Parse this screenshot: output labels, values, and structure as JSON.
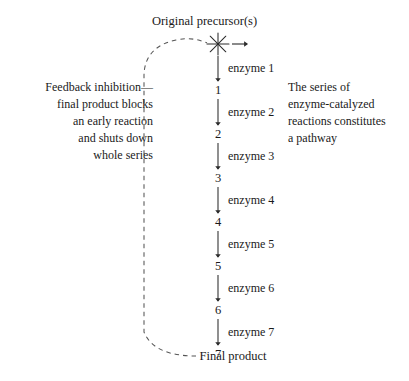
{
  "diagram": {
    "title_top": "Original precursor(s)",
    "final_product": "Final product",
    "axis_x": 218,
    "colors": {
      "ink": "#1a1a1a",
      "line": "#2b2b2b",
      "dashed": "#555555",
      "background": "#ffffff"
    },
    "notes": {
      "feedback": {
        "lines": [
          "Feedback inhibition—",
          "final product blocks",
          "an early reaction",
          "and shuts down",
          "whole series"
        ],
        "text": "Feedback inhibition—\nfinal product blocks\nan early reaction\nand shuts down\nwhole series"
      },
      "pathway": {
        "lines": [
          "The series of",
          "enzyme-catalyzed",
          "reactions constitutes",
          "a pathway"
        ],
        "text": "The series of\nenzyme-catalyzed\nreactions constitutes\na pathway"
      }
    },
    "starburst": {
      "name": "inhibition-point",
      "rays": 8,
      "cx": 218,
      "cy": 44,
      "radius": 11
    },
    "steps": [
      {
        "enzyme": "enzyme 1",
        "enzyme_y": 68,
        "product": "1",
        "product_y": 90
      },
      {
        "enzyme": "enzyme 2",
        "enzyme_y": 112,
        "product": "2",
        "product_y": 134
      },
      {
        "enzyme": "enzyme 3",
        "enzyme_y": 156,
        "product": "3",
        "product_y": 178
      },
      {
        "enzyme": "enzyme 4",
        "enzyme_y": 200,
        "product": "4",
        "product_y": 222
      },
      {
        "enzyme": "enzyme 5",
        "enzyme_y": 244,
        "product": "5",
        "product_y": 266
      },
      {
        "enzyme": "enzyme 6",
        "enzyme_y": 288,
        "product": "6",
        "product_y": 310
      },
      {
        "enzyme": "enzyme 7",
        "enzyme_y": 332,
        "product": "7",
        "product_y": 354
      }
    ]
  }
}
